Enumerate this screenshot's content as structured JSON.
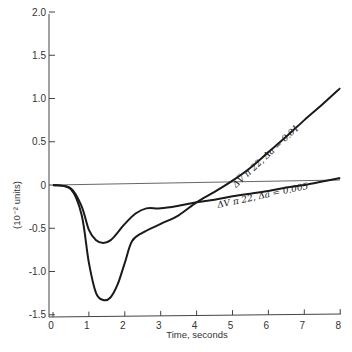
{
  "chart_data": {
    "type": "line",
    "title": "",
    "xlabel": "Time, seconds",
    "ylabel": "(10⁻² units)",
    "xlim": [
      0,
      8
    ],
    "ylim": [
      -1.5,
      2.0
    ],
    "x_ticks": [
      "0",
      "1",
      "2",
      "3",
      "4",
      "5",
      "6",
      "7",
      "8"
    ],
    "y_ticks": [
      "2.0",
      "1.5",
      "1.0",
      "0.5",
      "0",
      "-0.5",
      "-1.0",
      "-1.5"
    ],
    "grid": false,
    "legend": null,
    "reference_line": {
      "label": "zero",
      "y": 0,
      "x_end": 8,
      "y_end": 0.05
    },
    "series": [
      {
        "name": "ΔV̅ π 22, Δa = 0.01",
        "x": [
          0,
          0.5,
          0.8,
          1.0,
          1.2,
          1.4,
          1.6,
          1.8,
          2.0,
          2.2,
          2.5,
          3.0,
          3.5,
          4.0,
          4.5,
          5.0,
          5.5,
          6.0,
          6.5,
          7.0,
          7.5,
          8.0
        ],
        "values": [
          0,
          -0.05,
          -0.35,
          -0.9,
          -1.25,
          -1.33,
          -1.3,
          -1.15,
          -0.9,
          -0.65,
          -0.55,
          -0.45,
          -0.35,
          -0.2,
          -0.08,
          0.05,
          0.2,
          0.38,
          0.56,
          0.75,
          0.93,
          1.12
        ]
      },
      {
        "name": "ΔV̅ π 22, Δa = 0.005",
        "x": [
          0,
          0.5,
          0.8,
          1.0,
          1.2,
          1.4,
          1.6,
          1.8,
          2.0,
          2.3,
          2.6,
          3.0,
          3.5,
          4.0,
          4.5,
          5.0,
          5.5,
          6.0,
          6.5,
          7.0,
          7.5,
          8.0
        ],
        "values": [
          0,
          -0.04,
          -0.25,
          -0.52,
          -0.64,
          -0.67,
          -0.64,
          -0.55,
          -0.45,
          -0.33,
          -0.27,
          -0.27,
          -0.24,
          -0.2,
          -0.17,
          -0.13,
          -0.1,
          -0.07,
          -0.03,
          0.0,
          0.04,
          0.08
        ]
      }
    ],
    "annotations": [
      {
        "text": "ΔV̅ π 22,  Δa = 0.01",
        "near_x": 6.3,
        "near_y": 0.55,
        "rotation_deg": -42
      },
      {
        "text": "ΔV̅ π 22,  Δa = 0.005",
        "near_x": 5.7,
        "near_y": -0.2,
        "rotation_deg": -12
      }
    ]
  },
  "labels": {
    "xlabel": "Time, seconds",
    "ylabel": "(10⁻² units)",
    "annot_a": "ΔV̅ π 22,  Δa = 0.01",
    "annot_b": "ΔV̅ π 22,  Δa = 0.005"
  }
}
